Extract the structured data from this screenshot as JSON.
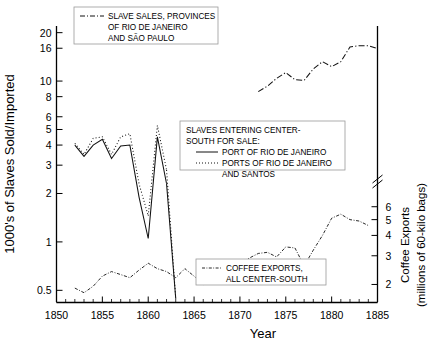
{
  "chart_data": {
    "type": "line",
    "title": "",
    "xlabel": "Year",
    "ylabel": "1000's of Slaves Sold/Imported",
    "ylabel_right_line1": "Coffee Exports",
    "ylabel_right_line2": "(millions of 60-kilo bags)",
    "xlim": [
      1850,
      1885
    ],
    "xticks": [
      1850,
      1855,
      1860,
      1865,
      1870,
      1875,
      1880,
      1885
    ],
    "xtick_labels": [
      "1850",
      "1855",
      "1860",
      "1865",
      "1870",
      "1875",
      "1880",
      "1885"
    ],
    "x_minor_step": 1,
    "yscale": "log",
    "ylim": [
      0.42,
      22
    ],
    "yticks": [
      0.5,
      1,
      2,
      3,
      4,
      5,
      6,
      8,
      10,
      16,
      20
    ],
    "ytick_labels": [
      "0.5",
      "1",
      "2",
      "3",
      "4",
      "5",
      "6",
      "8",
      "10",
      "16",
      "20"
    ],
    "y2scale": "log",
    "y2lim": [
      1.55,
      7.6
    ],
    "y2ticks": [
      2,
      3,
      4,
      5,
      6
    ],
    "y2tick_labels": [
      "2",
      "3",
      "4",
      "5",
      "6"
    ],
    "y2_axis_break": true,
    "grid": false,
    "legend_position": [
      "top-center",
      "middle-center",
      "bottom-center"
    ],
    "series": [
      {
        "name": "SLAVE SALES, PROVINCES OF RIO DE JANEIRO AND SÃO PAULO",
        "style": "dash-dot",
        "axis": "left",
        "x": [
          1872,
          1873,
          1874,
          1875,
          1876,
          1877,
          1878,
          1879,
          1880,
          1881,
          1882,
          1883,
          1884,
          1885
        ],
        "y": [
          8.6,
          9.3,
          10.4,
          11.3,
          10.2,
          10.1,
          11.9,
          13.2,
          12.3,
          13.2,
          16.3,
          16.6,
          16.6,
          15.9
        ]
      },
      {
        "name": "PORT OF RIO DE JANEIRO",
        "style": "solid",
        "axis": "left",
        "x": [
          1852,
          1853,
          1854,
          1855,
          1856,
          1857,
          1858,
          1859,
          1860,
          1861,
          1862,
          1863
        ],
        "y": [
          4.0,
          3.4,
          4.0,
          4.35,
          3.3,
          3.95,
          4.0,
          1.9,
          1.05,
          4.5,
          2.3,
          0.0
        ]
      },
      {
        "name": "PORTS OF RIO DE JANEIRO AND SANTOS",
        "style": "dotted",
        "axis": "left",
        "x": [
          1852,
          1853,
          1854,
          1855,
          1856,
          1857,
          1858,
          1859,
          1860,
          1861,
          1862,
          1863
        ],
        "y": [
          4.1,
          3.5,
          4.4,
          4.5,
          3.5,
          4.5,
          4.7,
          2.3,
          1.45,
          5.3,
          2.8,
          0.0
        ]
      },
      {
        "name": "COFFEE EXPORTS, ALL CENTER-SOUTH",
        "style": "dash-dot-fine",
        "axis": "right",
        "x": [
          1852,
          1853,
          1854,
          1855,
          1856,
          1857,
          1858,
          1859,
          1860,
          1861,
          1862,
          1863,
          1864,
          1865,
          1866,
          1867,
          1868,
          1869,
          1870,
          1871,
          1872,
          1873,
          1874,
          1875,
          1876,
          1877,
          1878,
          1879,
          1880,
          1881,
          1882,
          1883,
          1884
        ],
        "y": [
          1.9,
          1.78,
          1.95,
          2.25,
          2.4,
          2.3,
          2.2,
          2.45,
          2.7,
          2.5,
          2.4,
          2.2,
          2.5,
          2.25,
          2.0,
          2.2,
          2.45,
          2.5,
          2.7,
          2.9,
          3.1,
          3.15,
          2.95,
          3.4,
          3.35,
          2.6,
          3.25,
          4.0,
          5.1,
          5.4,
          5.0,
          4.9,
          4.6
        ]
      }
    ]
  },
  "legends": {
    "top": {
      "marker": "dash-dot",
      "lines": [
        "SLAVE SALES, PROVINCES",
        "OF RIO DE JANEIRO",
        "AND SÃO PAULO"
      ]
    },
    "middle": {
      "title_line1": "SLAVES ENTERING CENTER-",
      "title_line2": "SOUTH FOR SALE:",
      "entries": [
        {
          "marker": "solid",
          "label": "PORT OF RIO DE JANEIRO"
        },
        {
          "marker": "dotted",
          "label": "PORTS OF RIO DE JANEIRO"
        },
        {
          "marker": "none",
          "label": "AND SANTOS"
        }
      ]
    },
    "bottom": {
      "marker": "dash-dot-fine",
      "lines": [
        "COFFEE EXPORTS,",
        "ALL CENTER-SOUTH"
      ]
    }
  },
  "colors": {
    "ink": "#000000",
    "legend_border": "#9a9a9a",
    "background": "#ffffff"
  }
}
